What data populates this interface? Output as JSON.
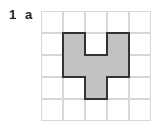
{
  "question": {
    "number": "1",
    "part": "a"
  },
  "grid": {
    "rows": 5,
    "cols": 5,
    "cell_px": 22,
    "line_color": "#d8d8d8"
  },
  "shape": {
    "fill": "#c2c2c2",
    "stroke": "#333333",
    "cells": [
      [
        1,
        1
      ],
      [
        1,
        3
      ],
      [
        2,
        1
      ],
      [
        2,
        2
      ],
      [
        2,
        3
      ],
      [
        3,
        2
      ]
    ]
  }
}
